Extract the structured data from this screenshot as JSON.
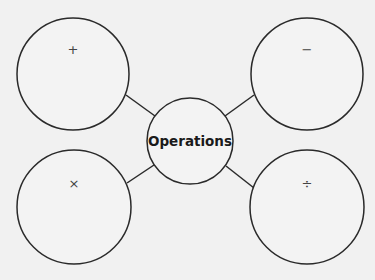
{
  "diagram": {
    "center": {
      "label": "Operations",
      "cx": 190,
      "cy": 141,
      "r": 43
    },
    "nodes": [
      {
        "id": "addition",
        "symbol": "+",
        "cx": 73,
        "cy": 74,
        "r": 56
      },
      {
        "id": "subtraction",
        "symbol": "−",
        "cx": 307,
        "cy": 74,
        "r": 56
      },
      {
        "id": "multiplication",
        "symbol": "×",
        "cx": 74,
        "cy": 207,
        "r": 57
      },
      {
        "id": "division",
        "symbol": "÷",
        "cx": 307,
        "cy": 207,
        "r": 57
      }
    ],
    "colors": {
      "stroke": "#2a2a2a",
      "background": "#f1f1f1"
    }
  }
}
